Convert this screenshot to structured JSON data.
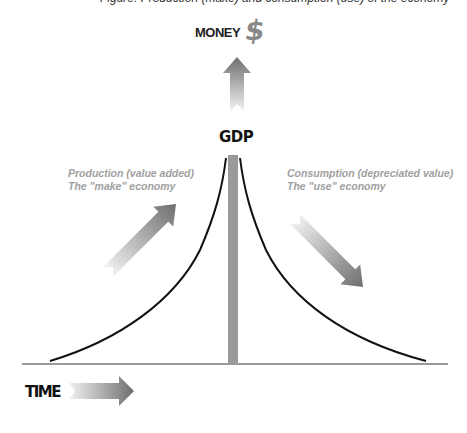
{
  "caption": "Figure: Production (make) and consumption (use) of the economy",
  "labels": {
    "money": "MONEY",
    "dollar_symbol": "$",
    "gdp": "GDP",
    "production_line1": "Production (value added)",
    "production_line2": "The \"make\" economy",
    "consumption_line1": "Consumption (depreciated value)",
    "consumption_line2": "The \"use\" economy",
    "time": "TIME"
  },
  "colors": {
    "curve": "#111111",
    "gdp_bar": "#9a9a9a",
    "baseline": "#9a9a9a",
    "arrow_dark": "#707070",
    "arrow_light": "#f0f0f0",
    "label_text": "#a0a0a0"
  }
}
